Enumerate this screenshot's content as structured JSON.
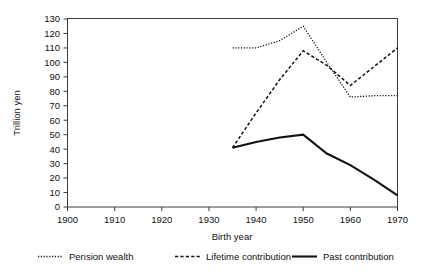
{
  "chart_data": {
    "type": "line",
    "title": "",
    "xlabel": "Birth year",
    "ylabel": "Trillion yen",
    "xlim": [
      1900,
      1970
    ],
    "ylim": [
      0,
      130
    ],
    "xticks": [
      1900,
      1910,
      1920,
      1930,
      1940,
      1950,
      1960,
      1970
    ],
    "yticks": [
      0,
      10,
      20,
      30,
      40,
      50,
      60,
      70,
      80,
      90,
      100,
      110,
      120,
      130
    ],
    "grid": false,
    "legend_position": "bottom",
    "series": [
      {
        "name": "Pension wealth",
        "style": "dotted",
        "x": [
          1935,
          1940,
          1945,
          1950,
          1955,
          1960,
          1965,
          1970
        ],
        "values": [
          110,
          110,
          115,
          125,
          100,
          76,
          77,
          77
        ]
      },
      {
        "name": "Lifetime contribution",
        "style": "dashed",
        "x": [
          1935,
          1940,
          1945,
          1950,
          1955,
          1960,
          1965,
          1970
        ],
        "values": [
          41,
          65,
          88,
          108,
          98,
          84,
          97,
          110
        ]
      },
      {
        "name": "Past contribution",
        "style": "solid",
        "x": [
          1935,
          1940,
          1945,
          1950,
          1955,
          1960,
          1965,
          1970
        ],
        "values": [
          41,
          45,
          48,
          50,
          37,
          29,
          19,
          8
        ]
      }
    ]
  },
  "axes": {
    "y_title": "Trillion yen",
    "x_title": "Birth year",
    "y_tick_labels": [
      "0",
      "10",
      "20",
      "30",
      "40",
      "50",
      "60",
      "70",
      "80",
      "90",
      "100",
      "110",
      "120",
      "130"
    ],
    "x_tick_labels": [
      "1900",
      "1910",
      "1920",
      "1930",
      "1940",
      "1950",
      "1960",
      "1970"
    ]
  },
  "legend": {
    "items": [
      {
        "label": "Pension wealth",
        "style": "dotted"
      },
      {
        "label": "Lifetime contribution",
        "style": "dashed"
      },
      {
        "label": "Past contribution",
        "style": "solid"
      }
    ]
  },
  "colors": {
    "line": "#111111",
    "frame": "#3c3c3c",
    "background": "#ffffff"
  }
}
